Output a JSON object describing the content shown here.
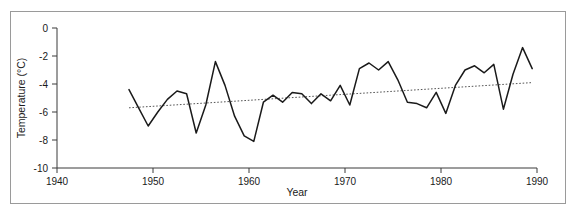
{
  "chart_data": {
    "type": "line",
    "title": "",
    "subtitle": "",
    "xlabel": "Year",
    "ylabel": "Temperature (°C)",
    "xlim": [
      1940,
      1990
    ],
    "ylim": [
      -10,
      0
    ],
    "xticks": [
      1940,
      1950,
      1960,
      1970,
      1980,
      1990
    ],
    "yticks": [
      0,
      -2,
      -4,
      -6,
      -8,
      -10
    ],
    "xtick_labels": [
      "1940",
      "1950",
      "1960",
      "1970",
      "1980",
      "1990"
    ],
    "ytick_labels": [
      "0",
      "-2",
      "-4",
      "-6",
      "-8",
      "-10"
    ],
    "grid": false,
    "legend": "none",
    "series": [
      {
        "name": "Temperature",
        "style": "solid",
        "color": "#1a1a1a",
        "x": [
          1947.5,
          1948.5,
          1949.5,
          1950.5,
          1951.5,
          1952.5,
          1953.5,
          1954.5,
          1955.5,
          1956.5,
          1957.5,
          1958.5,
          1959.5,
          1960.5,
          1961.5,
          1962.5,
          1963.5,
          1964.5,
          1965.5,
          1966.5,
          1967.5,
          1968.5,
          1969.5,
          1970.5,
          1971.5,
          1972.5,
          1973.5,
          1974.5,
          1975.5,
          1976.5,
          1977.5,
          1978.5,
          1979.5,
          1980.5,
          1981.5,
          1982.5,
          1983.5,
          1984.5,
          1985.5,
          1986.5,
          1987.5,
          1988.5,
          1989.5
        ],
        "y": [
          -4.4,
          -5.7,
          -7.0,
          -6.0,
          -5.1,
          -4.5,
          -4.7,
          -7.5,
          -5.5,
          -2.4,
          -4.1,
          -6.3,
          -7.7,
          -8.1,
          -5.3,
          -4.8,
          -5.3,
          -4.6,
          -4.7,
          -5.4,
          -4.7,
          -5.2,
          -4.1,
          -5.5,
          -2.9,
          -2.5,
          -3.0,
          -2.4,
          -3.7,
          -5.3,
          -5.4,
          -5.7,
          -4.6,
          -6.1,
          -4.1,
          -3.0,
          -2.7,
          -3.2,
          -2.6,
          -5.8,
          -3.3,
          -1.4,
          -2.9
        ]
      },
      {
        "name": "Trend",
        "style": "dotted",
        "color": "#555555",
        "x": [
          1947.5,
          1989.5
        ],
        "y": [
          -5.7,
          -3.9
        ]
      }
    ]
  },
  "axes": {
    "ylabel": "Temperature (°C)",
    "xlabel": "Year"
  }
}
